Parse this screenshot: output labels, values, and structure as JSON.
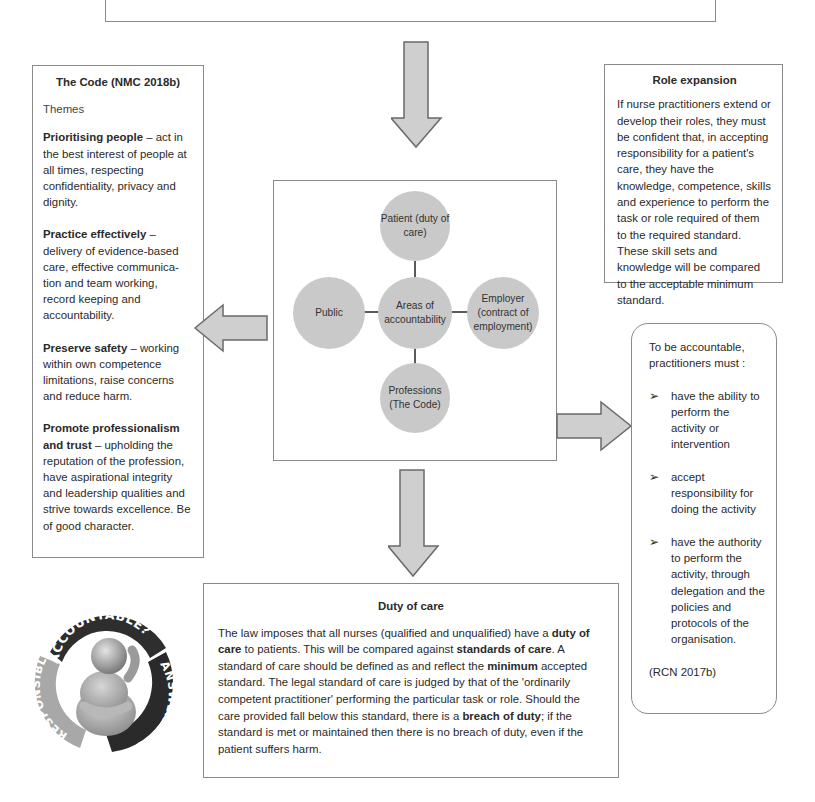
{
  "top_box": {
    "partial_text": "failure to comply with this Code may lead to their removal from the register"
  },
  "code_box": {
    "title": "The Code (NMC 2018b)",
    "subtitle": "Themes",
    "themes": [
      {
        "bold": "Prioritising people",
        "text": " – act in the best interest of people at all times, respecting confidentiality, privacy and dignity."
      },
      {
        "bold": "Practice effectively",
        "text": " – delivery of evidence-based care, effective communica-tion and team working, record keeping and accountability."
      },
      {
        "bold": "Preserve safety",
        "text": " – working within own competence limitations, raise concerns and reduce harm."
      },
      {
        "bold": "Promote professionalism and trust",
        "text": " – upholding the reputation of the profession, have aspirational integrity and leadership qualities and strive towards excellence. Be of good character."
      }
    ]
  },
  "role_box": {
    "title": "Role expansion",
    "text": "If nurse practitioners extend or develop their roles, they must be confident that, in accepting responsibility for a patient's care, they have the knowledge, competence, skills and experience to perform the task or role required of them to the required standard. These skill sets and knowledge will be compared to the acceptable minimum standard."
  },
  "diagram": {
    "center": "Areas of accountability",
    "top": "Patient (duty of care)",
    "left": "Public",
    "right": "Employer (contract of employment)",
    "bottom": "Professions (The Code)",
    "circle_color": "#c9c9c9",
    "line_color": "#5a5a5a"
  },
  "accountable_box": {
    "intro": "To be accountable, practitioners must :",
    "bullet_marker": "➢",
    "items": [
      "have the ability to perform the activity or intervention",
      "accept responsibility for doing the activity",
      "have the authority to perform the activity, through delegation and the policies and protocols of the organisation."
    ],
    "citation": "(RCN 2017b)"
  },
  "duty_box": {
    "title": "Duty of care",
    "segments": [
      {
        "t": "The law imposes that all nurses (qualified and unqualified) have a ",
        "b": false
      },
      {
        "t": "duty of care",
        "b": true
      },
      {
        "t": " to patients. This will be compared against ",
        "b": false
      },
      {
        "t": "standards of care",
        "b": true
      },
      {
        "t": ". A standard of care should be defined as and reflect the ",
        "b": false
      },
      {
        "t": "minimum",
        "b": true
      },
      {
        "t": " accepted standard. The legal standard of care is judged by that of the 'ordinarily competent practitioner' performing the particular task or role. Should the care provided fall below this standard, there is a ",
        "b": false
      },
      {
        "t": "breach of duty",
        "b": true
      },
      {
        "t": "; if the standard is met or maintained then there is no breach of duty, even if the patient suffers harm.",
        "b": false
      }
    ]
  },
  "badge": {
    "top": "ACCOUNTABLE?",
    "left": "RESPONSIBLE?",
    "right": "ANSWERABLE?"
  },
  "arrows": {
    "fill": "#cfcfcf",
    "stroke": "#6a6a6a"
  }
}
